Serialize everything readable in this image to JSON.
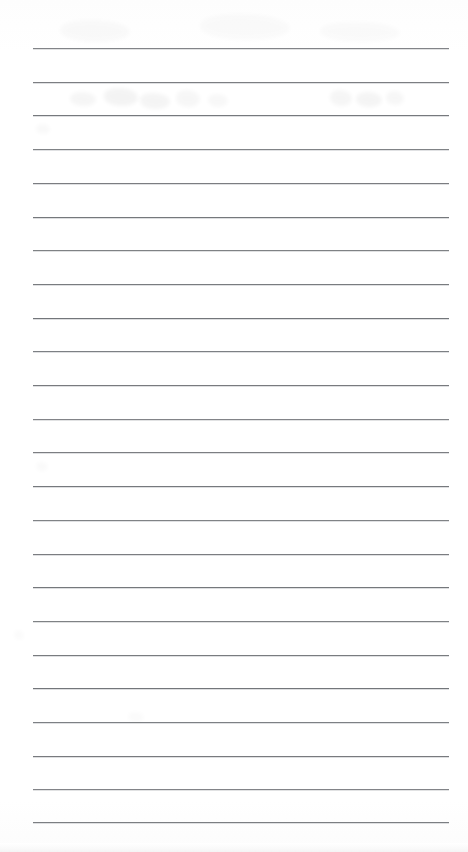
{
  "document": {
    "kind": "scanned-lined-paper",
    "title": "Blank ruled notebook page",
    "page_width": 468,
    "page_height": 852,
    "background_color": "#ffffff",
    "rule_color": "#6e7175",
    "content_text": "",
    "note": "No text content is written on the page"
  },
  "ruling": {
    "line_count": 24,
    "first_line_y": 48,
    "line_spacing": 33.7,
    "line_left_x": 33,
    "line_right_x": 449,
    "line_thickness": 1,
    "lines_y": [
      48,
      81.7,
      115.4,
      149.1,
      182.8,
      216.5,
      250.2,
      283.9,
      317.6,
      351.3,
      385,
      418.7,
      452.4,
      486.1,
      519.8,
      553.5,
      587.2,
      620.9,
      654.6,
      688.3,
      722,
      755.7,
      789.4,
      822
    ]
  },
  "artifacts": {
    "description": "faint scanner ghosting and bleed-through smudges",
    "marks": [
      {
        "x": 70,
        "y": 92,
        "w": 26,
        "h": 14,
        "opacity": 0.035
      },
      {
        "x": 104,
        "y": 88,
        "w": 34,
        "h": 18,
        "opacity": 0.045
      },
      {
        "x": 140,
        "y": 93,
        "w": 30,
        "h": 16,
        "opacity": 0.038
      },
      {
        "x": 176,
        "y": 90,
        "w": 24,
        "h": 17,
        "opacity": 0.03
      },
      {
        "x": 208,
        "y": 94,
        "w": 20,
        "h": 13,
        "opacity": 0.026
      },
      {
        "x": 330,
        "y": 90,
        "w": 22,
        "h": 16,
        "opacity": 0.034
      },
      {
        "x": 356,
        "y": 92,
        "w": 26,
        "h": 15,
        "opacity": 0.04
      },
      {
        "x": 386,
        "y": 91,
        "w": 18,
        "h": 14,
        "opacity": 0.03
      },
      {
        "x": 60,
        "y": 20,
        "w": 70,
        "h": 22,
        "opacity": 0.018
      },
      {
        "x": 200,
        "y": 14,
        "w": 90,
        "h": 26,
        "opacity": 0.016
      },
      {
        "x": 320,
        "y": 22,
        "w": 80,
        "h": 20,
        "opacity": 0.014
      },
      {
        "x": 36,
        "y": 124,
        "w": 14,
        "h": 10,
        "opacity": 0.022
      },
      {
        "x": 36,
        "y": 462,
        "w": 12,
        "h": 9,
        "opacity": 0.018
      },
      {
        "x": 14,
        "y": 630,
        "w": 10,
        "h": 10,
        "opacity": 0.016
      },
      {
        "x": 128,
        "y": 712,
        "w": 16,
        "h": 10,
        "opacity": 0.015
      }
    ]
  }
}
